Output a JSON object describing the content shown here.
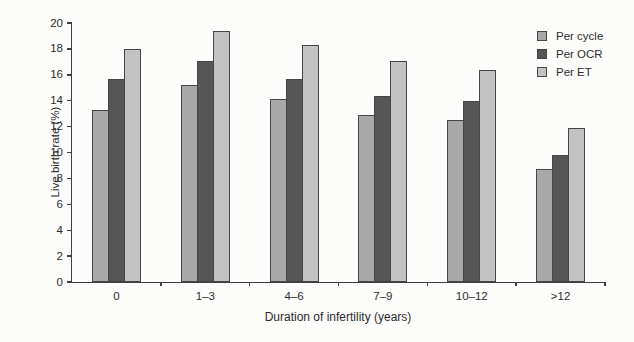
{
  "figure": {
    "background": "#fcfcfa",
    "axis_color": "#3f3f3f",
    "text_color": "#2c2c2c"
  },
  "chart_data": {
    "type": "bar",
    "title": "",
    "xlabel": "Duration of infertility (years)",
    "ylabel": "Live birth rate (%)",
    "ylim": [
      0,
      20
    ],
    "ytick_step": 2,
    "yticks": [
      0,
      2,
      4,
      6,
      8,
      10,
      12,
      14,
      16,
      18,
      20
    ],
    "categories": [
      "0",
      "1–3",
      "4–6",
      "7–9",
      "10–12",
      ">12"
    ],
    "series": [
      {
        "name": "Per cycle",
        "color": "#a9a9a9",
        "values": [
          13.3,
          15.2,
          14.1,
          12.9,
          12.5,
          8.7
        ]
      },
      {
        "name": "Per OCR",
        "color": "#565656",
        "values": [
          15.7,
          17.1,
          15.7,
          14.4,
          14.0,
          9.8
        ]
      },
      {
        "name": "Per ET",
        "color": "#c3c3c3",
        "values": [
          18.0,
          19.4,
          18.3,
          17.1,
          16.4,
          11.9
        ]
      }
    ],
    "bar_border_color": "#454545",
    "legend_position": "top-right",
    "grid": false
  }
}
